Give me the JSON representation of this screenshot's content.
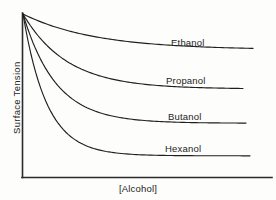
{
  "chart_data": {
    "type": "line",
    "title": "",
    "subtitle": "",
    "xlabel": "[Alcohol]",
    "ylabel": "Surface Tension",
    "grid": false,
    "legend": "inline-curve-labels",
    "axes": {
      "x_ticks": [],
      "y_ticks": [],
      "xlim": [
        0,
        1
      ],
      "ylim": [
        0,
        1
      ],
      "x_axis_arrow": false,
      "y_axis_arrow": false
    },
    "x": [
      0,
      0.05,
      0.1,
      0.15,
      0.2,
      0.3,
      0.4,
      0.5,
      0.6,
      0.7,
      0.8,
      0.9,
      1.0
    ],
    "series": [
      {
        "name": "Ethanol",
        "label": "Ethanol",
        "plateau": 0.78,
        "decay": 3.2,
        "values": [
          1.0,
          0.969,
          0.942,
          0.918,
          0.896,
          0.861,
          0.836,
          0.818,
          0.805,
          0.796,
          0.789,
          0.784,
          0.781
        ]
      },
      {
        "name": "Propanol",
        "label": "Propanol",
        "plateau": 0.54,
        "decay": 5.0,
        "values": [
          1.0,
          0.917,
          0.852,
          0.801,
          0.761,
          0.705,
          0.672,
          0.652,
          0.64,
          0.633,
          0.628,
          0.626,
          0.624
        ]
      },
      {
        "name": "Butanol",
        "label": "Butanol",
        "plateau": 0.33,
        "decay": 6.8,
        "values": [
          1.0,
          0.857,
          0.756,
          0.684,
          0.633,
          0.57,
          0.537,
          0.519,
          0.51,
          0.505,
          0.502,
          0.501,
          0.5
        ]
      },
      {
        "name": "Hexanol",
        "label": "Hexanol",
        "plateau": 0.13,
        "decay": 9.5,
        "values": [
          1.0,
          0.784,
          0.65,
          0.567,
          0.514,
          0.458,
          0.434,
          0.424,
          0.419,
          0.417,
          0.416,
          0.416,
          0.416
        ]
      }
    ]
  },
  "chart": {
    "ylabel_text": "Surface Tension",
    "xlabel_text": "[Alcohol]",
    "labels": {
      "ethanol": "Ethanol",
      "propanol": "Propanol",
      "butanol": "Butanol",
      "hexanol": "Hexanol"
    },
    "colors": {
      "background": "#fdfdfb",
      "axis": "#2b2b2b",
      "curve": "#1f1f1f",
      "text": "#232323"
    }
  }
}
